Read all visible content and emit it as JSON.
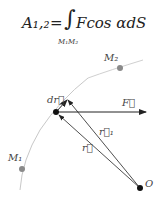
{
  "formula": {
    "lhs": "A₁,₂",
    "eq": "=",
    "integral": "∫",
    "integrand": "Fcos αdS",
    "limit": "M₁M₂"
  },
  "labels": {
    "m2": "M₂",
    "m1": "M₁",
    "dr": "dr⃗",
    "F": "F⃗",
    "r1": "r⃗₁",
    "r": "r⃗",
    "O": "O"
  },
  "colors": {
    "line": "#222222",
    "curve": "#c8c8c8",
    "point_gray": "#8a8a8a"
  }
}
